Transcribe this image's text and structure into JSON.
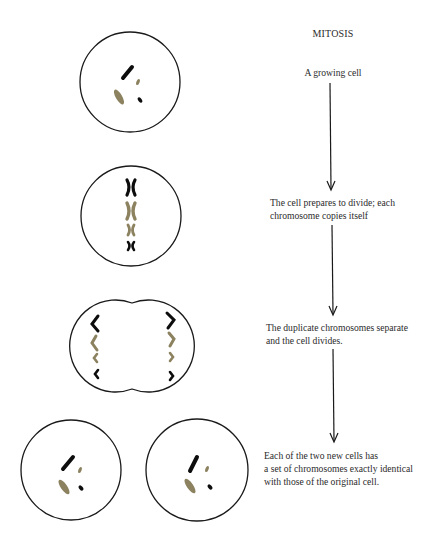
{
  "title": "MITOSIS",
  "stages": [
    {
      "id": "growing",
      "label_lines": [
        "A growing cell"
      ]
    },
    {
      "id": "prepare",
      "label_lines": [
        "The cell prepares to divide; each",
        "chromosome copies itself"
      ]
    },
    {
      "id": "separate",
      "label_lines": [
        "The duplicate chromosomes separate",
        "and the cell divides."
      ]
    },
    {
      "id": "result",
      "label_lines": [
        "Each of the two new cells has",
        "a set of chromosomes exactly identical",
        "with those of the original cell."
      ]
    }
  ],
  "colors": {
    "outline": "#1a1a1a",
    "chromosome_dark": "#0d0d0d",
    "chromosome_olive": "#8c8260",
    "arrow": "#1a1a1a",
    "text": "#2b2b2b"
  },
  "arrows": [
    {
      "from_stage": "growing",
      "to_stage": "prepare"
    },
    {
      "from_stage": "prepare",
      "to_stage": "separate"
    },
    {
      "from_stage": "separate",
      "to_stage": "result"
    }
  ]
}
